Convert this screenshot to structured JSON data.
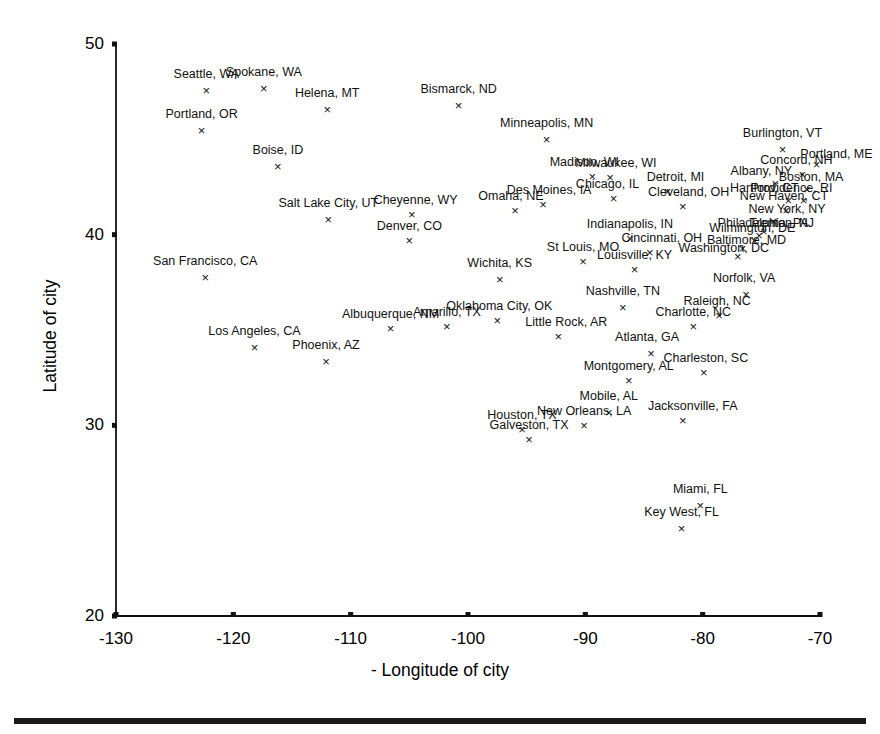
{
  "figure": {
    "bottom_rule": "decorative-rule"
  },
  "chart_data": {
    "type": "scatter",
    "title": "",
    "xlabel": "- Longitude of city",
    "ylabel": "Latitude of city",
    "xlim": [
      -130,
      -70
    ],
    "ylim": [
      20,
      50
    ],
    "xticks": [
      -130,
      -120,
      -110,
      -100,
      -90,
      -80,
      -70
    ],
    "xticklabels": [
      "-130",
      "-120",
      "-110",
      "-100",
      "-90",
      "-80",
      "-70"
    ],
    "yticks": [
      20,
      30,
      40,
      50
    ],
    "yticklabels": [
      "20",
      "30",
      "40",
      "50"
    ],
    "grid": false,
    "legend": null,
    "marker": "x",
    "points": [
      {
        "label": "Seattle, WA",
        "x": -122.3,
        "y": 47.6,
        "lx": 0,
        "ly": -14
      },
      {
        "label": "Spokane, WA",
        "x": -117.4,
        "y": 47.7,
        "lx": 0,
        "ly": -14
      },
      {
        "label": "Helena, MT",
        "x": -112.0,
        "y": 46.6,
        "lx": 0,
        "ly": -14
      },
      {
        "label": "Portland, OR",
        "x": -122.7,
        "y": 45.5,
        "lx": 0,
        "ly": -14
      },
      {
        "label": "Bismarck, ND",
        "x": -100.8,
        "y": 46.8,
        "lx": 0,
        "ly": -14
      },
      {
        "label": "Minneapolis, MN",
        "x": -93.3,
        "y": 45.0,
        "lx": 0,
        "ly": -14
      },
      {
        "label": "Boise, ID",
        "x": -116.2,
        "y": 43.6,
        "lx": 0,
        "ly": -14
      },
      {
        "label": "Burlington, VT",
        "x": -73.2,
        "y": 44.5,
        "lx": 0,
        "ly": -14
      },
      {
        "label": "Portland, ME",
        "x": -70.3,
        "y": 43.7,
        "lx": 20,
        "ly": -8
      },
      {
        "label": "Concord, NH",
        "x": -71.5,
        "y": 43.2,
        "lx": -6,
        "ly": -12
      },
      {
        "label": "Madison, WI",
        "x": -89.4,
        "y": 43.1,
        "lx": -8,
        "ly": -12
      },
      {
        "label": "Milwaukee, WI",
        "x": -87.9,
        "y": 43.0,
        "lx": 6,
        "ly": -12
      },
      {
        "label": "Detroit, MI",
        "x": -83.0,
        "y": 42.3,
        "lx": 8,
        "ly": -12
      },
      {
        "label": "Albany, NY",
        "x": -73.8,
        "y": 42.7,
        "lx": -14,
        "ly": -10
      },
      {
        "label": "Boston, MA",
        "x": -71.1,
        "y": 42.4,
        "lx": 4,
        "ly": -10
      },
      {
        "label": "Salt Lake City, UT",
        "x": -111.9,
        "y": 40.8,
        "lx": 0,
        "ly": -14
      },
      {
        "label": "Cheyenne, WY",
        "x": -104.8,
        "y": 41.1,
        "lx": 4,
        "ly": -12
      },
      {
        "label": "Denver, CO",
        "x": -105.0,
        "y": 39.7,
        "lx": 0,
        "ly": -12
      },
      {
        "label": "Omaha, NE",
        "x": -96.0,
        "y": 41.3,
        "lx": -4,
        "ly": -12
      },
      {
        "label": "Des Moines, IA",
        "x": -93.6,
        "y": 41.6,
        "lx": 6,
        "ly": -12
      },
      {
        "label": "Chicago, IL",
        "x": -87.6,
        "y": 41.9,
        "lx": -6,
        "ly": -12
      },
      {
        "label": "Cleveland, OH",
        "x": -81.7,
        "y": 41.5,
        "lx": 6,
        "ly": -12
      },
      {
        "label": "New Haven, CT",
        "x": -72.9,
        "y": 41.3,
        "lx": -2,
        "ly": -12
      },
      {
        "label": "Hartford, CT",
        "x": -72.7,
        "y": 41.8,
        "lx": -24,
        "ly": -10
      },
      {
        "label": "Providence, RI",
        "x": -71.4,
        "y": 41.8,
        "lx": -12,
        "ly": -10
      },
      {
        "label": "Philadelphia, PA",
        "x": -75.2,
        "y": 40.0,
        "lx": 4,
        "ly": -10
      },
      {
        "label": "New York, NY",
        "x": -74.0,
        "y": 40.7,
        "lx": 14,
        "ly": -10
      },
      {
        "label": "Wilmington, DE",
        "x": -75.6,
        "y": 39.7,
        "lx": -2,
        "ly": -10
      },
      {
        "label": "Trenton, NJ",
        "x": -74.8,
        "y": 40.2,
        "lx": 18,
        "ly": -6
      },
      {
        "label": "Baltimore, MD",
        "x": -76.6,
        "y": 39.3,
        "lx": 4,
        "ly": -6
      },
      {
        "label": "Washington, DC",
        "x": -77.0,
        "y": 38.9,
        "lx": -14,
        "ly": -6
      },
      {
        "label": "San Francisco, CA",
        "x": -122.4,
        "y": 37.8,
        "lx": 0,
        "ly": -14
      },
      {
        "label": "Indianapolis, IN",
        "x": -86.2,
        "y": 39.8,
        "lx": 0,
        "ly": -12
      },
      {
        "label": "St Louis, MO",
        "x": -90.2,
        "y": 38.6,
        "lx": 0,
        "ly": -12
      },
      {
        "label": "Cincinnati, OH",
        "x": -84.5,
        "y": 39.1,
        "lx": 12,
        "ly": -12
      },
      {
        "label": "Louisville, KY",
        "x": -85.8,
        "y": 38.2,
        "lx": 0,
        "ly": -12
      },
      {
        "label": "Wichita, KS",
        "x": -97.3,
        "y": 37.7,
        "lx": 0,
        "ly": -14
      },
      {
        "label": "Norfolk, VA",
        "x": -76.3,
        "y": 36.9,
        "lx": -2,
        "ly": -14
      },
      {
        "label": "Raleigh, NC",
        "x": -78.6,
        "y": 35.8,
        "lx": -2,
        "ly": -12
      },
      {
        "label": "Charlotte, NC",
        "x": -80.8,
        "y": 35.2,
        "lx": 0,
        "ly": -12
      },
      {
        "label": "Nashville, TN",
        "x": -86.8,
        "y": 36.2,
        "lx": 0,
        "ly": -14
      },
      {
        "label": "Oklahoma City, OK",
        "x": -97.5,
        "y": 35.5,
        "lx": 2,
        "ly": -12
      },
      {
        "label": "Little Rock, AR",
        "x": -92.3,
        "y": 34.7,
        "lx": 8,
        "ly": -12
      },
      {
        "label": "Amarillo, TX",
        "x": -101.8,
        "y": 35.2,
        "lx": 0,
        "ly": -12
      },
      {
        "label": "Albuquerque, NM",
        "x": -106.6,
        "y": 35.1,
        "lx": 0,
        "ly": -12
      },
      {
        "label": "Los Angeles, CA",
        "x": -118.2,
        "y": 34.1,
        "lx": 0,
        "ly": -14
      },
      {
        "label": "Phoenix, AZ",
        "x": -112.1,
        "y": 33.4,
        "lx": 0,
        "ly": -14
      },
      {
        "label": "Atlanta, GA",
        "x": -84.4,
        "y": 33.8,
        "lx": -4,
        "ly": -14
      },
      {
        "label": "Charleston, SC",
        "x": -79.9,
        "y": 32.8,
        "lx": 2,
        "ly": -12
      },
      {
        "label": "Montgomery, AL",
        "x": -86.3,
        "y": 32.4,
        "lx": 0,
        "ly": -12
      },
      {
        "label": "Mobile, AL",
        "x": -88.0,
        "y": 30.7,
        "lx": 0,
        "ly": -14
      },
      {
        "label": "New Orleans, LA",
        "x": -90.1,
        "y": 30.0,
        "lx": 0,
        "ly": -12
      },
      {
        "label": "Jacksonville, FA",
        "x": -81.7,
        "y": 30.3,
        "lx": 10,
        "ly": -12
      },
      {
        "label": "Houston, TX",
        "x": -95.4,
        "y": 29.8,
        "lx": 0,
        "ly": -12
      },
      {
        "label": "Galveston, TX",
        "x": -94.8,
        "y": 29.3,
        "lx": 0,
        "ly": -12
      },
      {
        "label": "Miami, FL",
        "x": -80.2,
        "y": 25.8,
        "lx": 0,
        "ly": -14
      },
      {
        "label": "Key West, FL",
        "x": -81.8,
        "y": 24.6,
        "lx": 0,
        "ly": -14
      }
    ]
  }
}
